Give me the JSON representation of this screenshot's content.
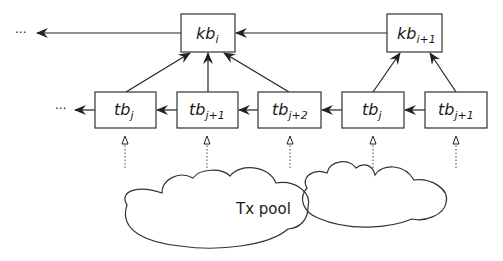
{
  "diagram": {
    "type": "blockchain-structure",
    "colors": {
      "stroke": "#333333",
      "fill": "#ffffff",
      "text": "#1a1a1a"
    },
    "ellipsis": "···",
    "key_blocks": [
      {
        "id": "kb_i",
        "base": "kb",
        "sub": "i"
      },
      {
        "id": "kb_i+1",
        "base": "kb",
        "sub": "i+1"
      }
    ],
    "tx_blocks": [
      {
        "id": "tb_j_a",
        "base": "tb",
        "sub": "j"
      },
      {
        "id": "tb_j+1_a",
        "base": "tb",
        "sub": "j+1"
      },
      {
        "id": "tb_j+2_a",
        "base": "tb",
        "sub": "j+2"
      },
      {
        "id": "tb_j_b",
        "base": "tb",
        "sub": "j"
      },
      {
        "id": "tb_j+1_b",
        "base": "tb",
        "sub": "j+1"
      }
    ],
    "edges": [
      {
        "from": "kb_i",
        "to": "previous",
        "style": "solid"
      },
      {
        "from": "kb_i+1",
        "to": "kb_i",
        "style": "solid"
      },
      {
        "from": "tb_j_a",
        "to": "kb_i",
        "style": "solid"
      },
      {
        "from": "tb_j+1_a",
        "to": "kb_i",
        "style": "solid"
      },
      {
        "from": "tb_j+2_a",
        "to": "kb_i",
        "style": "solid"
      },
      {
        "from": "tb_j_b",
        "to": "kb_i+1",
        "style": "solid"
      },
      {
        "from": "tb_j+1_b",
        "to": "kb_i+1",
        "style": "solid"
      },
      {
        "from": "tb_j_a",
        "to": "previous",
        "style": "solid"
      },
      {
        "from": "tb_j+1_a",
        "to": "tb_j_a",
        "style": "solid"
      },
      {
        "from": "tb_j+2_a",
        "to": "tb_j+1_a",
        "style": "solid"
      },
      {
        "from": "tb_j_b",
        "to": "tb_j+2_a",
        "style": "solid"
      },
      {
        "from": "tb_j+1_b",
        "to": "tb_j_b",
        "style": "solid"
      },
      {
        "from": "tx_pool",
        "to": "each tx block",
        "style": "dotted"
      }
    ],
    "pool": {
      "label": "Tx pool"
    }
  }
}
